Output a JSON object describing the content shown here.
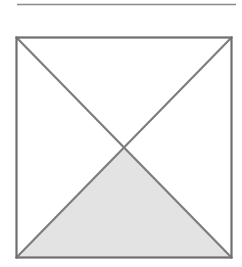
{
  "figure": {
    "canvas": {
      "width": 242,
      "height": 267,
      "background_color": "#ffffff"
    },
    "colors": {
      "stroke": "#7d7d7d",
      "stroke_dark": "#6e6e6e",
      "shaded_fill": "#e3e3e3",
      "unshaded_fill": "#ffffff",
      "rule": "#8a8a8a"
    },
    "rule": {
      "name": "horizontal-rule",
      "x1": 17,
      "y1": 4.5,
      "x2": 236,
      "y2": 4.5,
      "thickness": 1.6
    },
    "square": {
      "name": "outer-square",
      "left": 16.5,
      "top": 37.5,
      "right": 231.5,
      "bottom": 257.5,
      "width": 215,
      "height": 220,
      "stroke_width": 2.2,
      "fill": "#ffffff"
    },
    "center": {
      "x": 124,
      "y": 147.5
    },
    "diagonals": [
      {
        "name": "diagonal-top-left-to-bottom-right",
        "x1": 16.5,
        "y1": 37.5,
        "x2": 231.5,
        "y2": 257.5,
        "stroke_width": 2.2
      },
      {
        "name": "diagonal-top-right-to-bottom-left",
        "x1": 231.5,
        "y1": 37.5,
        "x2": 16.5,
        "y2": 257.5,
        "stroke_width": 2.2
      }
    ],
    "regions": [
      {
        "name": "top-triangle",
        "position": "top",
        "shaded": false,
        "fill": "#ffffff",
        "points": "16.5,37.5 231.5,37.5 124,147.5"
      },
      {
        "name": "left-triangle",
        "position": "left",
        "shaded": false,
        "fill": "#ffffff",
        "points": "16.5,37.5 124,147.5 16.5,257.5"
      },
      {
        "name": "right-triangle",
        "position": "right",
        "shaded": false,
        "fill": "#ffffff",
        "points": "231.5,37.5 231.5,257.5 124,147.5"
      },
      {
        "name": "bottom-triangle",
        "position": "bottom",
        "shaded": true,
        "fill": "#e3e3e3",
        "points": "16.5,257.5 124,147.5 231.5,257.5"
      }
    ],
    "shaded_region_count": 1,
    "total_region_count": 4,
    "shaded_fraction": "1/4"
  }
}
